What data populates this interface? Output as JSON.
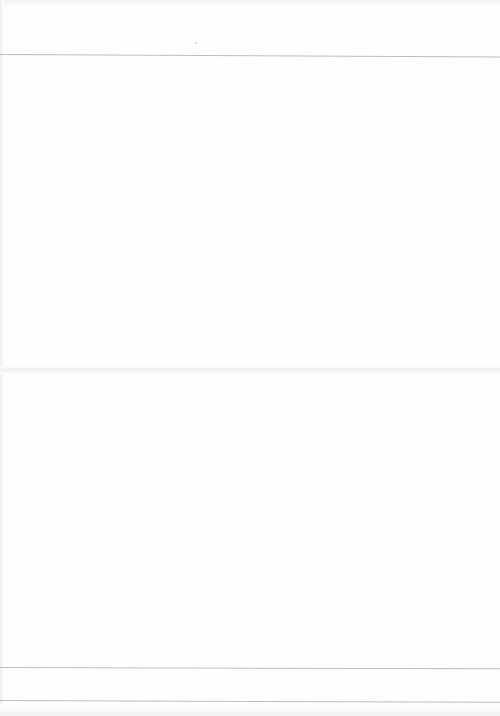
{
  "document": {
    "type": "scanned-blank-page",
    "text_content": "",
    "rules": [
      {
        "name": "header-rule",
        "y": 54
      },
      {
        "name": "footer-rule-1",
        "y": 667
      },
      {
        "name": "footer-rule-2",
        "y": 700
      }
    ],
    "fold_line_y": 368,
    "colors": {
      "paper": "#fefefe",
      "rule": "#bdbdbd"
    }
  }
}
